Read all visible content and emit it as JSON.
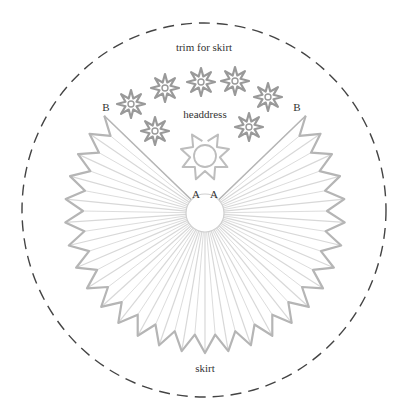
{
  "diagram": {
    "labels": {
      "trim": "trim for skirt",
      "headdress": "headdress",
      "skirt": "skirt",
      "point_a_left": "A",
      "point_a_right": "A",
      "point_b_left": "B",
      "point_b_right": "B"
    },
    "colors": {
      "dash_circle": "#444444",
      "star_outline": "#999999",
      "skirt_outline": "#b5b5b5",
      "pleat_line": "#d8d8d8",
      "text": "#333333"
    },
    "cut_circle": {
      "cx": 204,
      "cy": 210,
      "rx": 182,
      "ry": 187
    },
    "skirt": {
      "cx": 205,
      "cy": 213,
      "inner_r": 19,
      "outer_r": 140,
      "notch_r": 122,
      "start_deg": -136,
      "end_deg": -44,
      "pleats": 28
    },
    "headdress": {
      "cx": 205,
      "cy": 156,
      "inner_r": 11,
      "outer_r": 25,
      "points": 8
    },
    "trim_stars": [
      {
        "cx": 131,
        "cy": 104
      },
      {
        "cx": 165,
        "cy": 88
      },
      {
        "cx": 201,
        "cy": 82
      },
      {
        "cx": 235,
        "cy": 81
      },
      {
        "cx": 268,
        "cy": 97
      },
      {
        "cx": 155,
        "cy": 131
      },
      {
        "cx": 249,
        "cy": 127
      }
    ]
  }
}
